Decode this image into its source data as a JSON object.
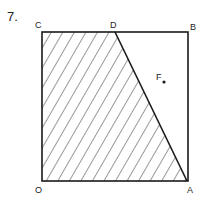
{
  "problem_number": "7.",
  "points": {
    "C": {
      "label": "C",
      "x": 42,
      "y": 32
    },
    "D": {
      "label": "D",
      "x": 115,
      "y": 32
    },
    "B": {
      "label": "B",
      "x": 188,
      "y": 32
    },
    "O": {
      "label": "O",
      "x": 42,
      "y": 181
    },
    "A": {
      "label": "A",
      "x": 187,
      "y": 181
    },
    "F": {
      "label": "F",
      "x": 163,
      "y": 82
    }
  },
  "shaded_region": [
    "O",
    "C",
    "D",
    "A"
  ],
  "colors": {
    "stroke": "#1a1a1a",
    "hatch": "#333333",
    "background": "#ffffff"
  }
}
